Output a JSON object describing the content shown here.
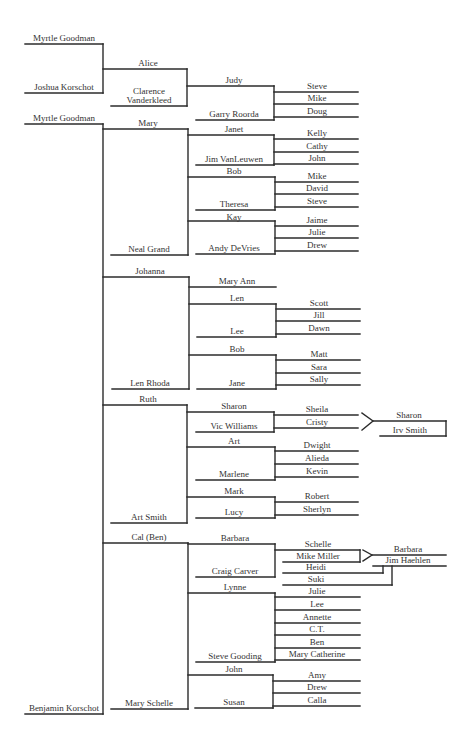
{
  "page": {
    "background": "#ffffff",
    "line_color": "#2b2b2b",
    "text_color": "#333333"
  },
  "families": {
    "myrtle_joshua": {
      "parent_a": "Myrtle Goodman",
      "parent_b": "Joshua Korschot"
    },
    "alice_clarence": {
      "parent_a": "Alice",
      "parent_b": [
        "Clarence",
        "Vanderkleed"
      ]
    },
    "judy_garry": {
      "parent_a": "Judy",
      "parent_b": "Garry Roorda",
      "children": [
        "Steve",
        "Mike",
        "Doug"
      ]
    },
    "myrtle_benjamin": {
      "parent_a": "Myrtle Goodman",
      "parent_b": "Benjamin Korschot"
    },
    "mary_neal": {
      "parent_a": "Mary",
      "parent_b": "Neal Grand"
    },
    "janet_jim": {
      "parent_a": "Janet",
      "parent_b": "Jim VanLeuwen",
      "children": [
        "Kelly",
        "Cathy",
        "John"
      ]
    },
    "bob_theresa": {
      "parent_a": "Bob",
      "parent_b": "Theresa",
      "children": [
        "Mike",
        "David",
        "Steve"
      ]
    },
    "kay_andy": {
      "parent_a": "Kay",
      "parent_b": "Andy DeVries",
      "children": [
        "Jaime",
        "Julie",
        "Drew"
      ]
    },
    "johanna_len": {
      "parent_a": "Johanna",
      "parent_b": "Len Rhoda",
      "children": [
        "Mary Ann"
      ]
    },
    "len_lee": {
      "parent_a": "Len",
      "parent_b": "Lee",
      "children": [
        "Scott",
        "Jill",
        "Dawn"
      ]
    },
    "bob_jane": {
      "parent_a": "Bob",
      "parent_b": "Jane",
      "children": [
        "Matt",
        "Sara",
        "Sally"
      ]
    },
    "ruth_art": {
      "parent_a": "Ruth",
      "parent_b": "Art Smith"
    },
    "sharon_vic": {
      "parent_a": "Sharon",
      "parent_b": "Vic Williams",
      "children": [
        "Sheila",
        "Cristy"
      ]
    },
    "sharon_irv": {
      "parent_a": "Sharon",
      "parent_b": "Irv Smith"
    },
    "art_marlene": {
      "parent_a": "Art",
      "parent_b": "Marlene",
      "children": [
        "Dwight",
        "Alieda",
        "Kevin"
      ]
    },
    "mark_lucy": {
      "parent_a": "Mark",
      "parent_b": "Lucy",
      "children": [
        "Robert",
        "Sherlyn"
      ]
    },
    "cal_mary": {
      "parent_a": "Cal (Ben)",
      "parent_b": "Mary Schelle"
    },
    "barbara_craig": {
      "parent_a": "Barbara",
      "parent_b": "Craig Carver",
      "children": [
        "Schelle"
      ]
    },
    "schelle_mike": {
      "spouse": "Mike Miller"
    },
    "barbara_jim": {
      "parent_a": "Barbara",
      "parent_b": "Jim Haehlen",
      "children": [
        "Heidi",
        "Suki"
      ]
    },
    "lynne_steve": {
      "parent_a": "Lynne",
      "parent_b": "Steve Gooding",
      "children": [
        "Julie",
        "Lee",
        "Annette",
        "C.T.",
        "Ben",
        "Mary Catherine"
      ]
    },
    "john_susan": {
      "parent_a": "John",
      "parent_b": "Susan",
      "children": [
        "Amy",
        "Drew",
        "Calla"
      ]
    }
  }
}
